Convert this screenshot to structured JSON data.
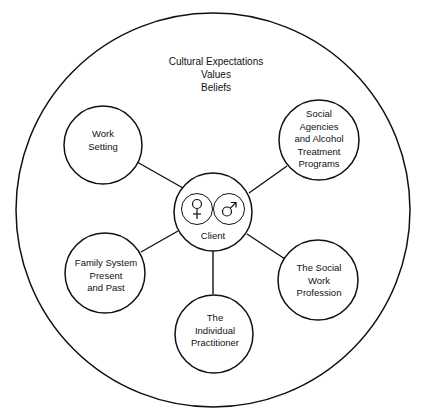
{
  "diagram": {
    "context_text": [
      "Cultural Expectations",
      "Values",
      "Beliefs"
    ],
    "center": {
      "label": "Client",
      "symbols": [
        "♀",
        "♂"
      ],
      "symbol_names": [
        "female-symbol",
        "male-symbol"
      ]
    },
    "nodes": [
      {
        "id": "work-setting",
        "lines": [
          "Work",
          "Setting"
        ]
      },
      {
        "id": "social-agencies",
        "lines": [
          "Social",
          "Agencies",
          "and Alcohol",
          "Treatment",
          "Programs"
        ]
      },
      {
        "id": "family-system",
        "lines": [
          "Family System",
          "Present",
          "and Past"
        ]
      },
      {
        "id": "social-work-profession",
        "lines": [
          "The Social",
          "Work",
          "Profession"
        ]
      },
      {
        "id": "individual-practitioner",
        "lines": [
          "The",
          "Individual",
          "Practitioner"
        ]
      }
    ],
    "edges": [
      [
        "client",
        "work-setting"
      ],
      [
        "client",
        "social-agencies"
      ],
      [
        "client",
        "family-system"
      ],
      [
        "client",
        "social-work-profession"
      ],
      [
        "client",
        "individual-practitioner"
      ]
    ],
    "colors": {
      "stroke": "#111111",
      "background": "#ffffff",
      "text": "#111111"
    }
  }
}
